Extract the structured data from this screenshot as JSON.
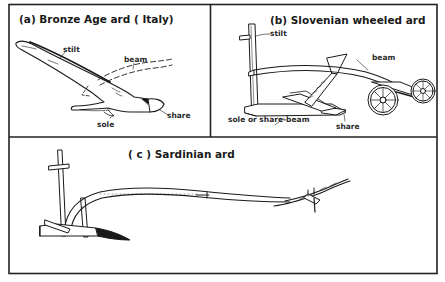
{
  "figure": {
    "panels": [
      {
        "id": "a",
        "title": "(a)  Bronze Age ard ( Italy)",
        "parts": {
          "stilt": "stilt",
          "beam": "beam",
          "share": "share",
          "sole": "sole"
        }
      },
      {
        "id": "b",
        "title": "(b)  Slovenian  wheeled  ard",
        "parts": {
          "stilt": "stilt",
          "beam": "beam",
          "sole": "sole or share-beam",
          "share": "share"
        }
      },
      {
        "id": "c",
        "title": "( c )  Sardinian  ard",
        "parts": {}
      }
    ],
    "colors": {
      "ink": "#1a1a1a",
      "paper": "#ffffff"
    }
  }
}
